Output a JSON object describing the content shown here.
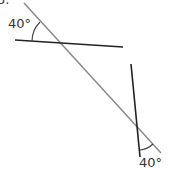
{
  "problem_number": "3.",
  "diagram": {
    "transversal": {
      "x1": 24,
      "y1": 3,
      "x2": 161,
      "y2": 153,
      "color": "#8a8a8a"
    },
    "line_a": {
      "x1": 15,
      "y1": 40,
      "x2": 123,
      "y2": 47,
      "color": "#222222"
    },
    "line_b": {
      "x1": 131,
      "y1": 64,
      "x2": 140,
      "y2": 157,
      "color": "#222222"
    },
    "angles": [
      {
        "label": "40°",
        "vertex": "top-left intersection"
      },
      {
        "label": "40°",
        "vertex": "bottom-right intersection"
      }
    ]
  }
}
